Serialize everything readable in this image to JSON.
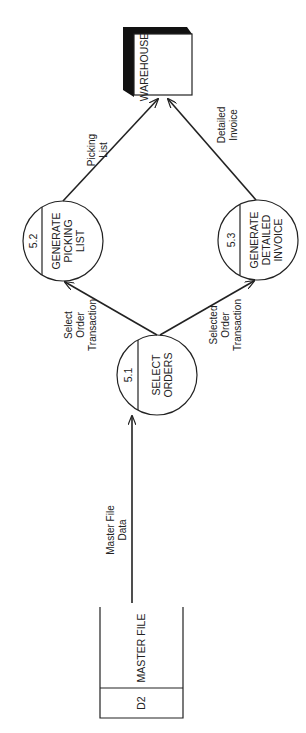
{
  "diagram": {
    "type": "data-flow-diagram",
    "orientation": "rotated-90-ccw",
    "data_store": {
      "id": "D2",
      "name": "MASTER FILE"
    },
    "processes": [
      {
        "id": "5.1",
        "line1": "SELECT",
        "line2": "ORDERS",
        "line3": ""
      },
      {
        "id": "5.2",
        "line1": "GENERATE",
        "line2": "PICKING",
        "line3": "LIST"
      },
      {
        "id": "5.3",
        "line1": "GENERATE",
        "line2": "DETAILED",
        "line3": "INVOICE"
      }
    ],
    "external_entity": {
      "name": "WAREHOUSE"
    },
    "flows": [
      {
        "from": "D2",
        "to": "5.1",
        "line1": "Master File",
        "line2": "Data",
        "line3": ""
      },
      {
        "from": "5.1",
        "to": "5.2",
        "line1": "Select",
        "line2": "Order",
        "line3": "Transaction"
      },
      {
        "from": "5.1",
        "to": "5.3",
        "line1": "Selected",
        "line2": "Order",
        "line3": "Transaction"
      },
      {
        "from": "5.2",
        "to": "WAREHOUSE",
        "line1": "Picking",
        "line2": "List",
        "line3": ""
      },
      {
        "from": "5.3",
        "to": "WAREHOUSE",
        "line1": "Detailed",
        "line2": "Invoice",
        "line3": ""
      }
    ]
  }
}
